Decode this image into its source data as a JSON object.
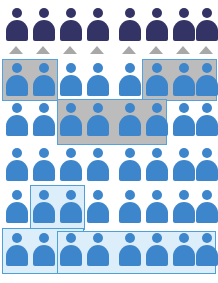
{
  "graphic": {
    "title": "People pictogram grid with highlighted groups",
    "type": "pictogram",
    "columns": 8,
    "rows": 6,
    "total_figures": 48,
    "marker_count": 8,
    "colors": {
      "navy_figure": "#333366",
      "blue_figure": "#3e86cc",
      "gray_highlight_fill": "#bcbcbc",
      "blue_highlight_fill": "#ddeefb",
      "highlight_border": "#53a2dd",
      "marker_gray": "#a8a8a8",
      "background": "#ffffff"
    },
    "layout": {
      "width": 218,
      "height": 283,
      "column_x": [
        6,
        33,
        60,
        87,
        119,
        146,
        173,
        196
      ],
      "column_pitch": 27,
      "figure_width": 22,
      "figure_height": 33,
      "row_y": [
        8,
        63,
        103,
        148,
        190,
        233
      ],
      "gap_between_group_4_and_5": 5
    }
  },
  "figures": [
    {
      "id": "r1c1",
      "row": 1,
      "col": 1,
      "color": "navy",
      "x": 6,
      "y": 8
    },
    {
      "id": "r1c2",
      "row": 1,
      "col": 2,
      "color": "navy",
      "x": 33,
      "y": 8
    },
    {
      "id": "r1c3",
      "row": 1,
      "col": 3,
      "color": "navy",
      "x": 60,
      "y": 8
    },
    {
      "id": "r1c4",
      "row": 1,
      "col": 4,
      "color": "navy",
      "x": 87,
      "y": 8
    },
    {
      "id": "r1c5",
      "row": 1,
      "col": 5,
      "color": "navy",
      "x": 119,
      "y": 8
    },
    {
      "id": "r1c6",
      "row": 1,
      "col": 6,
      "color": "navy",
      "x": 146,
      "y": 8
    },
    {
      "id": "r1c7",
      "row": 1,
      "col": 7,
      "color": "navy",
      "x": 173,
      "y": 8
    },
    {
      "id": "r1c8",
      "row": 1,
      "col": 8,
      "color": "navy",
      "x": 196,
      "y": 8
    },
    {
      "id": "r2c1",
      "row": 2,
      "col": 1,
      "color": "blue",
      "x": 6,
      "y": 63
    },
    {
      "id": "r2c2",
      "row": 2,
      "col": 2,
      "color": "blue",
      "x": 33,
      "y": 63
    },
    {
      "id": "r2c3",
      "row": 2,
      "col": 3,
      "color": "blue",
      "x": 60,
      "y": 63
    },
    {
      "id": "r2c4",
      "row": 2,
      "col": 4,
      "color": "blue",
      "x": 87,
      "y": 63
    },
    {
      "id": "r2c5",
      "row": 2,
      "col": 5,
      "color": "blue",
      "x": 119,
      "y": 63
    },
    {
      "id": "r2c6",
      "row": 2,
      "col": 6,
      "color": "blue",
      "x": 146,
      "y": 63
    },
    {
      "id": "r2c7",
      "row": 2,
      "col": 7,
      "color": "blue",
      "x": 173,
      "y": 63
    },
    {
      "id": "r2c8",
      "row": 2,
      "col": 8,
      "color": "blue",
      "x": 196,
      "y": 63
    },
    {
      "id": "r3c1",
      "row": 3,
      "col": 1,
      "color": "blue",
      "x": 6,
      "y": 103
    },
    {
      "id": "r3c2",
      "row": 3,
      "col": 2,
      "color": "blue",
      "x": 33,
      "y": 103
    },
    {
      "id": "r3c3",
      "row": 3,
      "col": 3,
      "color": "blue",
      "x": 60,
      "y": 103
    },
    {
      "id": "r3c4",
      "row": 3,
      "col": 4,
      "color": "blue",
      "x": 87,
      "y": 103
    },
    {
      "id": "r3c5",
      "row": 3,
      "col": 5,
      "color": "blue",
      "x": 119,
      "y": 103
    },
    {
      "id": "r3c6",
      "row": 3,
      "col": 6,
      "color": "blue",
      "x": 146,
      "y": 103
    },
    {
      "id": "r3c7",
      "row": 3,
      "col": 7,
      "color": "blue",
      "x": 173,
      "y": 103
    },
    {
      "id": "r3c8",
      "row": 3,
      "col": 8,
      "color": "blue",
      "x": 196,
      "y": 103
    },
    {
      "id": "r4c1",
      "row": 4,
      "col": 1,
      "color": "blue",
      "x": 6,
      "y": 148
    },
    {
      "id": "r4c2",
      "row": 4,
      "col": 2,
      "color": "blue",
      "x": 33,
      "y": 148
    },
    {
      "id": "r4c3",
      "row": 4,
      "col": 3,
      "color": "blue",
      "x": 60,
      "y": 148
    },
    {
      "id": "r4c4",
      "row": 4,
      "col": 4,
      "color": "blue",
      "x": 87,
      "y": 148
    },
    {
      "id": "r4c5",
      "row": 4,
      "col": 5,
      "color": "blue",
      "x": 119,
      "y": 148
    },
    {
      "id": "r4c6",
      "row": 4,
      "col": 6,
      "color": "blue",
      "x": 146,
      "y": 148
    },
    {
      "id": "r4c7",
      "row": 4,
      "col": 7,
      "color": "blue",
      "x": 173,
      "y": 148
    },
    {
      "id": "r4c8",
      "row": 4,
      "col": 8,
      "color": "blue",
      "x": 196,
      "y": 148
    },
    {
      "id": "r5c1",
      "row": 5,
      "col": 1,
      "color": "blue",
      "x": 6,
      "y": 190
    },
    {
      "id": "r5c2",
      "row": 5,
      "col": 2,
      "color": "blue",
      "x": 33,
      "y": 190
    },
    {
      "id": "r5c3",
      "row": 5,
      "col": 3,
      "color": "blue",
      "x": 60,
      "y": 190
    },
    {
      "id": "r5c4",
      "row": 5,
      "col": 4,
      "color": "blue",
      "x": 87,
      "y": 190
    },
    {
      "id": "r5c5",
      "row": 5,
      "col": 5,
      "color": "blue",
      "x": 119,
      "y": 190
    },
    {
      "id": "r5c6",
      "row": 5,
      "col": 6,
      "color": "blue",
      "x": 146,
      "y": 190
    },
    {
      "id": "r5c7",
      "row": 5,
      "col": 7,
      "color": "blue",
      "x": 173,
      "y": 190
    },
    {
      "id": "r5c8",
      "row": 5,
      "col": 8,
      "color": "blue",
      "x": 196,
      "y": 190
    },
    {
      "id": "r6c1",
      "row": 6,
      "col": 1,
      "color": "blue",
      "x": 6,
      "y": 233
    },
    {
      "id": "r6c2",
      "row": 6,
      "col": 2,
      "color": "blue",
      "x": 33,
      "y": 233
    },
    {
      "id": "r6c3",
      "row": 6,
      "col": 3,
      "color": "blue",
      "x": 60,
      "y": 233
    },
    {
      "id": "r6c4",
      "row": 6,
      "col": 4,
      "color": "blue",
      "x": 87,
      "y": 233
    },
    {
      "id": "r6c5",
      "row": 6,
      "col": 5,
      "color": "blue",
      "x": 119,
      "y": 233
    },
    {
      "id": "r6c6",
      "row": 6,
      "col": 6,
      "color": "blue",
      "x": 146,
      "y": 233
    },
    {
      "id": "r6c7",
      "row": 6,
      "col": 7,
      "color": "blue",
      "x": 173,
      "y": 233
    },
    {
      "id": "r6c8",
      "row": 6,
      "col": 8,
      "color": "blue",
      "x": 196,
      "y": 233
    }
  ],
  "markers": [
    {
      "id": "m1",
      "col": 1,
      "x": 9,
      "y": 46,
      "color": "#a8a8a8"
    },
    {
      "id": "m2",
      "col": 2,
      "x": 36,
      "y": 46,
      "color": "#a8a8a8"
    },
    {
      "id": "m3",
      "col": 3,
      "x": 63,
      "y": 46,
      "color": "#a8a8a8"
    },
    {
      "id": "m4",
      "col": 4,
      "x": 90,
      "y": 46,
      "color": "#a8a8a8"
    },
    {
      "id": "m5",
      "col": 5,
      "x": 122,
      "y": 46,
      "color": "#a8a8a8"
    },
    {
      "id": "m6",
      "col": 6,
      "x": 149,
      "y": 46,
      "color": "#a8a8a8"
    },
    {
      "id": "m7",
      "col": 7,
      "x": 176,
      "y": 46,
      "color": "#a8a8a8"
    },
    {
      "id": "m8",
      "col": 8,
      "x": 199,
      "y": 46,
      "color": "#a8a8a8"
    }
  ],
  "regions": [
    {
      "id": "g1",
      "style": "gray",
      "label": "gray-group-row2-left",
      "rows": "2",
      "cols": "1-2",
      "count": 2,
      "x": 2,
      "y": 59,
      "w": 56,
      "h": 42
    },
    {
      "id": "g2",
      "style": "gray",
      "label": "gray-group-row2-right",
      "rows": "2",
      "cols": "6-8",
      "count": 3,
      "x": 142,
      "y": 59,
      "w": 75,
      "h": 42
    },
    {
      "id": "g3",
      "style": "gray",
      "label": "gray-group-row3-middle",
      "rows": "3",
      "cols": "3-6",
      "count": 4,
      "x": 57,
      "y": 99,
      "w": 110,
      "h": 46
    },
    {
      "id": "b1",
      "style": "blue",
      "label": "blue-group-row5-mid",
      "rows": "5",
      "cols": "2-3",
      "count": 2,
      "x": 30,
      "y": 185,
      "w": 55,
      "h": 45
    },
    {
      "id": "b2",
      "style": "blue",
      "label": "blue-group-row6-left",
      "rows": "6",
      "cols": "1-3",
      "count": 3,
      "x": 2,
      "y": 228,
      "w": 82,
      "h": 46
    },
    {
      "id": "b3",
      "style": "blue",
      "label": "blue-group-row6-right",
      "rows": "6",
      "cols": "3-8",
      "count": 6,
      "x": 57,
      "y": 231,
      "w": 159,
      "h": 43
    }
  ]
}
